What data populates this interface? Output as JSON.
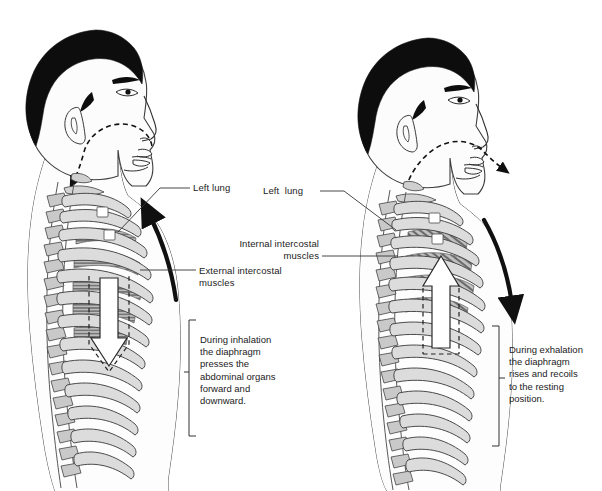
{
  "diagram": {
    "background_color": "#ffffff",
    "ink_color": "#1a1a1a",
    "bone_fill": "#d9d9d9",
    "muscle_fill": "#9a9a9a",
    "hair_fill": "#0d0d0d",
    "skin_fill": "#fbfbfb"
  },
  "left_panel": {
    "name": "inhalation-figure",
    "phase": "inhalation",
    "airflow": "air in",
    "labels": {
      "left_lung": "Left lung",
      "external_intercostal": "External intercostal\nmuscles"
    },
    "caption": "During inhalation\nthe diaphragm\npresses the\nabdominal organs\nforward and\ndownward.",
    "diaphragm_arrow": "down",
    "ribcage_arrow": "up"
  },
  "right_panel": {
    "name": "exhalation-figure",
    "phase": "exhalation",
    "airflow": "air out",
    "labels": {
      "left_lung": "Left  lung",
      "internal_intercostal": "Internal intercostal\nmuscles"
    },
    "caption": "During exhalation\nthe diaphragm\nrises and recoils\nto the resting\nposition.",
    "diaphragm_arrow": "up",
    "ribcage_arrow": "down"
  }
}
